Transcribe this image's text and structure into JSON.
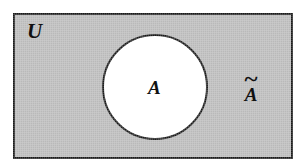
{
  "figure": {
    "kind": "venn-diagram",
    "caption_text": "",
    "canvas": {
      "width": 300,
      "height": 167,
      "background_color": "#ffffff"
    }
  },
  "universe": {
    "label": "U",
    "fill_color": "#b9b9b9",
    "stroke_color": "#1a1a1a",
    "stroke_width": 2,
    "x": 14,
    "y": 14,
    "width": 278,
    "height": 144
  },
  "set_a": {
    "label": "A",
    "fill_color": "#ffffff",
    "stroke_color": "#1a1a1a",
    "stroke_width": 2,
    "center_x": 155,
    "center_y": 87,
    "radius": 52
  },
  "complement": {
    "tilde": "~",
    "letter": "A",
    "label": "~A",
    "x": 250,
    "y": 98
  }
}
